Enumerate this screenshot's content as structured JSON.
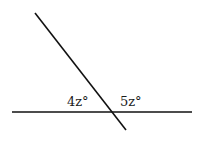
{
  "diagram": {
    "type": "intersecting-lines",
    "horizontal_line": {
      "x1": 12,
      "y1": 112,
      "x2": 192,
      "y2": 112
    },
    "transversal_line": {
      "x1": 35,
      "y1": 13,
      "x2": 126,
      "y2": 130
    },
    "angle_labels": [
      {
        "text": "4z°",
        "x": 67,
        "y": 106
      },
      {
        "text": "5z°",
        "x": 120,
        "y": 106
      }
    ],
    "stroke_color": "#111111"
  }
}
